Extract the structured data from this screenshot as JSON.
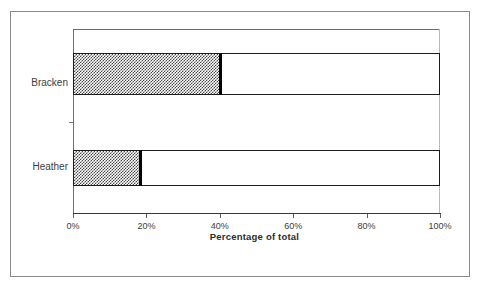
{
  "chart_data": {
    "type": "bar",
    "orientation": "horizontal",
    "stacked": true,
    "title": "",
    "xlabel": "Percentage of total",
    "ylabel": "",
    "categories": [
      "Bracken",
      "Heather"
    ],
    "xlim": [
      0,
      100
    ],
    "xticks": [
      0,
      20,
      40,
      60,
      80,
      100
    ],
    "xtick_labels": [
      "0%",
      "20%",
      "40%",
      "60%",
      "80%",
      "100%"
    ],
    "grid": false,
    "legend": "none",
    "series": [
      {
        "name": "filled",
        "fill": "hatched-gray",
        "values": [
          40.6,
          18.8
        ]
      },
      {
        "name": "remainder",
        "fill": "white",
        "values": [
          59.4,
          81.2
        ]
      }
    ],
    "colors": {
      "fill_pattern": "#4a4a4a",
      "bar_outline": "#1c1c1c",
      "segment_divider": "#000000",
      "axis": "#3a3a3a",
      "text": "#3d3d3d",
      "page_border": "#8a8a8a",
      "background": "#ffffff"
    }
  },
  "axis": {
    "title": "Percentage of total",
    "ticks": [
      {
        "label": "0%",
        "value": 0
      },
      {
        "label": "20%",
        "value": 20
      },
      {
        "label": "40%",
        "value": 40
      },
      {
        "label": "60%",
        "value": 60
      },
      {
        "label": "80%",
        "value": 80
      },
      {
        "label": "100%",
        "value": 100
      }
    ]
  },
  "bars": [
    {
      "label": "Bracken",
      "filled_percent": 40.6,
      "remainder_percent": 59.4
    },
    {
      "label": "Heather",
      "filled_percent": 18.8,
      "remainder_percent": 81.2
    }
  ]
}
